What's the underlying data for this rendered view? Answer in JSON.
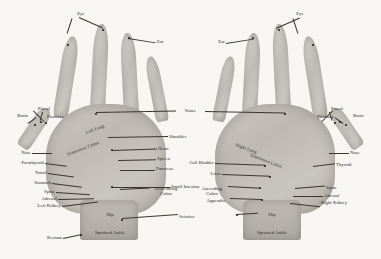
{
  "chart": {
    "background_color": "#f7f6f3",
    "ink_color": "#2a2722",
    "skin_color": "#c4c1ba"
  },
  "left_hand": {
    "name": "Left Hand (palm)",
    "labels": {
      "eye": "Eye",
      "ear": "Ear",
      "sinus": "Sinus",
      "brain": "Brain",
      "pineal": "Pineal",
      "pituitary": "Pituitary",
      "nose": "Nose",
      "parathyroid": "Parathyroid",
      "tonsil": "Tonsil",
      "stomach": "Stomach",
      "spine": "Spine",
      "adrenal": "Adrenal",
      "left_kidney": "Left Kidney",
      "rectum": "Rectum",
      "left_lung": "Left Lung",
      "transverse_colon": "Transverse Colon",
      "shoulder": "Shoulder",
      "heart": "Heart",
      "spleen": "Spleen",
      "pancreas": "Pancreas",
      "small_intestine": "Small Intestine",
      "descending_colon": "Descending Colon",
      "sciatica": "Sciatica",
      "hip": "Hip",
      "sprained_ankle": "Sprained Ankle"
    }
  },
  "right_hand": {
    "name": "Right Hand (palm)",
    "labels": {
      "eye": "Eye",
      "ear": "Ear",
      "brain": "Brain",
      "pineal": "Pineal",
      "pituitary": "Pituitary",
      "nose": "Nose",
      "thyroid": "Thyroid",
      "spine": "Spine",
      "adrenal": "Adrenal",
      "right_kidney": "Right Kidney",
      "right_lung": "Right Lung",
      "transverse_colon": "Transverse Colon",
      "gall_bladder": "Gall Bladder",
      "liver": "Liver",
      "ascending_colon": "Ascending Colon",
      "appendix": "Appendix",
      "hip": "Hip",
      "sprained_ankle": "Sprained Ankle"
    }
  }
}
